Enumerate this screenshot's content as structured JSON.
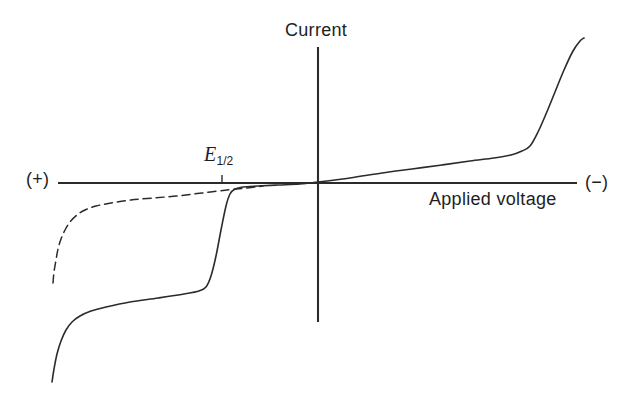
{
  "labels": {
    "y_axis": "Current",
    "x_axis": "Applied voltage",
    "left_polarity": "(+)",
    "right_polarity": "(−)",
    "half_wave_symbol": "E",
    "half_wave_subscript": "1/2"
  },
  "colors": {
    "line": "#2b2b2b",
    "background": "#ffffff"
  },
  "chart_data": {
    "type": "line",
    "title": "",
    "xlabel": "Applied voltage",
    "ylabel": "Current",
    "x_polarity_left": "(+)",
    "x_polarity_right": "(−)",
    "numeric_ticks": "none (qualitative plot, arbitrary units)",
    "annotations": [
      {
        "label": "E1/2",
        "tick_x_px": 222,
        "tick_y1_px": 175,
        "tick_y2_px": 183
      }
    ],
    "axes_px": {
      "origin": [
        318,
        183
      ],
      "h_axis": {
        "y": 183,
        "x1": 58,
        "x2": 577
      },
      "v_axis": {
        "x": 318,
        "y1": 47,
        "y2": 322
      }
    },
    "series": [
      {
        "name": "current-voltage-curve",
        "style": "solid",
        "stroke_width": 1.6,
        "points_px": [
          [
            52,
            382
          ],
          [
            54,
            369
          ],
          [
            57,
            354
          ],
          [
            61,
            341
          ],
          [
            66,
            330
          ],
          [
            72,
            322
          ],
          [
            80,
            316
          ],
          [
            91,
            311
          ],
          [
            106,
            307
          ],
          [
            130,
            302
          ],
          [
            158,
            298
          ],
          [
            184,
            294
          ],
          [
            199,
            291
          ],
          [
            206,
            287
          ],
          [
            211,
            276
          ],
          [
            216,
            256
          ],
          [
            221,
            230
          ],
          [
            226,
            206
          ],
          [
            230,
            194
          ],
          [
            235,
            189
          ],
          [
            243,
            187
          ],
          [
            258,
            186
          ],
          [
            278,
            185
          ],
          [
            300,
            184
          ],
          [
            318,
            182
          ],
          [
            350,
            178
          ],
          [
            382,
            173
          ],
          [
            412,
            169
          ],
          [
            442,
            165
          ],
          [
            470,
            161
          ],
          [
            494,
            158
          ],
          [
            511,
            155
          ],
          [
            522,
            151
          ],
          [
            530,
            146
          ],
          [
            538,
            132
          ],
          [
            546,
            114
          ],
          [
            555,
            92
          ],
          [
            564,
            70
          ],
          [
            573,
            51
          ],
          [
            580,
            41
          ],
          [
            584,
            38
          ]
        ]
      },
      {
        "name": "residual-current-curve",
        "style": "dashed",
        "stroke_width": 1.5,
        "dash": "8 5",
        "points_px": [
          [
            53,
            283
          ],
          [
            54,
            272
          ],
          [
            56,
            260
          ],
          [
            58,
            249
          ],
          [
            61,
            239
          ],
          [
            65,
            230
          ],
          [
            70,
            222
          ],
          [
            77,
            215
          ],
          [
            85,
            210
          ],
          [
            96,
            206
          ],
          [
            111,
            203
          ],
          [
            131,
            200
          ],
          [
            153,
            198
          ],
          [
            177,
            196
          ],
          [
            202,
            193
          ],
          [
            227,
            190
          ],
          [
            247,
            188
          ],
          [
            263,
            186
          ]
        ]
      }
    ]
  }
}
